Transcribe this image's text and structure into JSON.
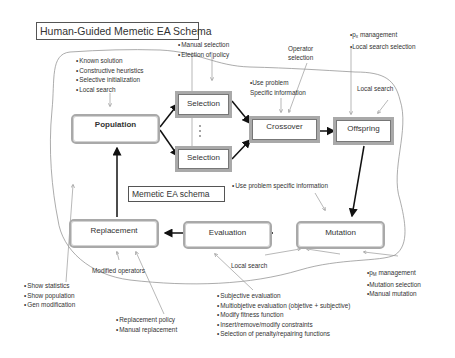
{
  "titles": {
    "outer": "Human-Guided  Memetic EA Schema",
    "inner": "Memetic EA schema"
  },
  "nodes": {
    "population": "Population",
    "selection_top": "Selection",
    "selection_bottom": "Selection",
    "crossover": "Crossover",
    "offspring": "Offspring",
    "mutation": "Mutation",
    "evaluation": "Evaluation",
    "replacement": "Replacement"
  },
  "annotations": {
    "population_init": [
      "Known solution",
      "Constructive heuristics",
      "Selective initialization",
      "Local search"
    ],
    "selection": [
      "Manual selection",
      "Election of policy"
    ],
    "operator_selection": [
      "Operator",
      "selection"
    ],
    "crossover_info": [
      "Use problem",
      "Specific information"
    ],
    "px_management": {
      "prefix": "p",
      "sub": "x",
      "rest": " management"
    },
    "crossover_prob": [
      "Local search selection"
    ],
    "offspring_local": "Local search",
    "mutation_info": [
      "Use problem specific information"
    ],
    "pm_management": {
      "prefix": "p",
      "sub": "M",
      "rest": " management"
    },
    "mutation_items": [
      "Mutation selection",
      "Manual mutation"
    ],
    "local_search_bottom": "Local search",
    "modified_operators": "Modified operators",
    "population_view": [
      "Show statistics",
      "Show population",
      "Gen modification"
    ],
    "replacement_items": [
      "Replacement policy",
      "Manual replacement"
    ],
    "evaluation_items": [
      "Subjective evaluation",
      "Multiobjetive evaluation (objetive + subjective)",
      "Modify fitness function",
      "Insert/remove/modify constraints",
      "Selection  of penalty/repairing  functions"
    ]
  },
  "colors": {
    "box_border": "#a9a9a9",
    "arrow": "#111111",
    "thin_line": "#9a9a9a"
  }
}
